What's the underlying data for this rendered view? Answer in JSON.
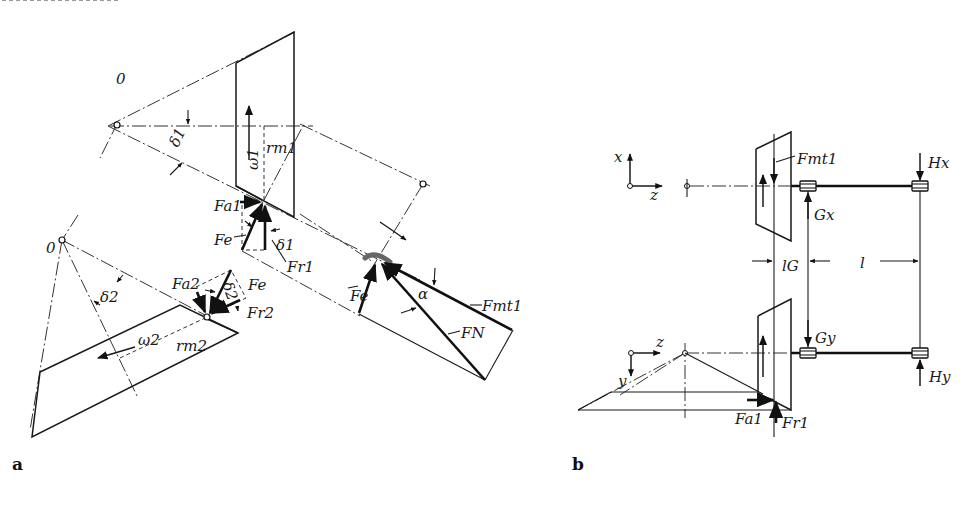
{
  "figure": {
    "type": "technical-diagram",
    "panels": [
      {
        "id": "a",
        "label": "a",
        "labels": {
          "apex_1": "0",
          "apex_2": "0",
          "pitch_angle_1": "δ1",
          "pitch_angle_2": "δ2",
          "angular_velocity_1": "ω1",
          "angular_velocity_2": "ω2",
          "mean_radius_1": "rm1",
          "mean_radius_2": "rm2",
          "axial_force_1": "Fa1",
          "axial_force_2": "Fa2",
          "radial_force_1": "Fr1",
          "radial_force_2": "Fr2",
          "equivalent_force_1": "Fe",
          "equivalent_force_2": "Fe",
          "equivalent_force_3": "Fe",
          "tangential_force": "Fmt1",
          "normal_force": "FN",
          "pressure_angle": "α"
        }
      },
      {
        "id": "b",
        "label": "b",
        "labels": {
          "axis_x": "x",
          "axis_z_top": "z",
          "axis_z_bottom": "z",
          "axis_y": "y",
          "tangential_force": "Fmt1",
          "bearing_reaction_Gx": "Gx",
          "bearing_reaction_Hx": "Hx",
          "bearing_reaction_Gy": "Gy",
          "bearing_reaction_Hy": "Hy",
          "distance_lG": "lG",
          "distance_l": "l",
          "axial_force": "Fa1",
          "radial_force": "Fr1"
        }
      }
    ]
  }
}
